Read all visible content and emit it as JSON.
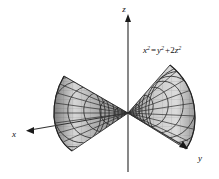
{
  "figure": {
    "background_color": "#ffffff",
    "equation": {
      "full_text": "x² = y² + 2z²",
      "x_base": "x",
      "x_exp": "2",
      "equals": "=",
      "y_base": "y",
      "y_exp": "2",
      "plus": "+",
      "z_coef": "2",
      "z_base": "z",
      "z_exp": "2"
    },
    "axes": [
      {
        "name": "x",
        "label": "x",
        "label_x": 14,
        "label_y": 136,
        "direction": "lower-left",
        "arrow_tip_x": 27,
        "arrow_tip_y": 130
      },
      {
        "name": "y",
        "label": "y",
        "label_x": 199,
        "label_y": 160,
        "direction": "lower-right",
        "arrow_tip_x": 187,
        "arrow_tip_y": 149
      },
      {
        "name": "z",
        "label": "z",
        "label_x": 124,
        "label_y": 12,
        "direction": "up",
        "arrow_tip_x": 128,
        "arrow_tip_y": 16
      }
    ],
    "surface": {
      "type": "elliptical double cone",
      "opens_along": "x-axis",
      "apex_x": 128,
      "apex_y": 113,
      "mesh_color": "#2b2b2b",
      "fill_light": "#d8d8d8",
      "fill_dark": "#8c8c8c",
      "nappes": 2
    },
    "colors": {
      "line": "#333333",
      "text": "#111111",
      "mesh": "#2b2b2b",
      "surface_light": "#d9d9d9",
      "surface_mid": "#b0b0b0",
      "surface_dark": "#7e7e7e"
    }
  }
}
